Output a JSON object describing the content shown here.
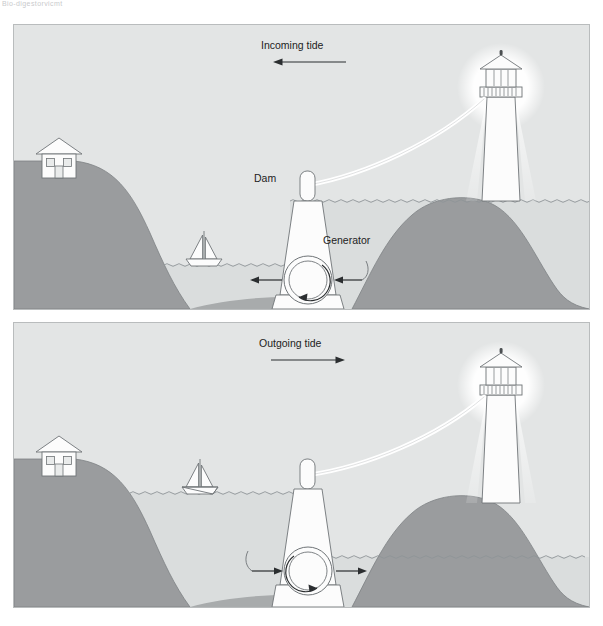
{
  "topbar": {
    "faint_text": "Bio-digestorvicmt"
  },
  "colors": {
    "sky": "#e3e5e5",
    "water": "#dcdfe0",
    "land_dark": "#9a9c9e",
    "land_mid": "#a8abac",
    "white": "#fcfcfc",
    "stroke": "#6f7477",
    "wave": "#8e9497",
    "text": "#222222",
    "panel_border": "#b9bcbd"
  },
  "panels": [
    {
      "id": "incoming",
      "title": "Incoming tide",
      "arrow_direction": "left",
      "labels": {
        "dam": "Dam",
        "generator": "Generator"
      },
      "flow_arrows": [
        "left",
        "left"
      ],
      "rotation": "counterclockwise",
      "water_levels": {
        "basin": "low",
        "sea": "high"
      },
      "elements": [
        "house",
        "sailboat",
        "dam",
        "generator",
        "lighthouse",
        "power-cable",
        "headland"
      ]
    },
    {
      "id": "outgoing",
      "title": "Outgoing tide",
      "arrow_direction": "right",
      "labels": {
        "dam": "",
        "generator": ""
      },
      "flow_arrows": [
        "right",
        "right"
      ],
      "rotation": "clockwise",
      "water_levels": {
        "basin": "high",
        "sea": "low"
      },
      "elements": [
        "house",
        "sailboat",
        "dam",
        "generator",
        "lighthouse",
        "power-cable",
        "headland"
      ]
    }
  ]
}
